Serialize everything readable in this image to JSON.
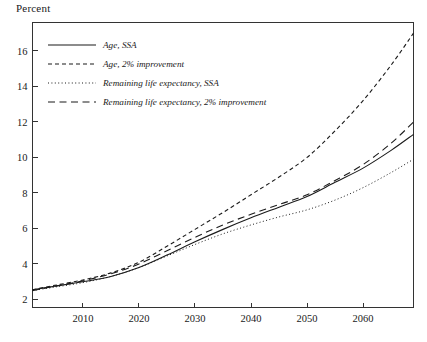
{
  "figure": {
    "ylabel_top": "Percent"
  },
  "chart_data": {
    "type": "line",
    "title": "",
    "xlabel": "",
    "ylabel": "Percent",
    "xlim": [
      2001,
      2069
    ],
    "ylim": [
      1.55,
      17.6
    ],
    "xticks": [
      2010,
      2020,
      2030,
      2040,
      2050,
      2060
    ],
    "xtick_labels": [
      "2010",
      "2020",
      "2030",
      "2040",
      "2050",
      "2060"
    ],
    "yticks": [
      2,
      4,
      6,
      8,
      10,
      12,
      14,
      16
    ],
    "ytick_labels": [
      "2",
      "4",
      "6",
      "8",
      "10",
      "12",
      "14",
      "16"
    ],
    "grid": false,
    "legend_position": "upper-left-inside",
    "x": [
      2001,
      2005,
      2010,
      2015,
      2020,
      2025,
      2030,
      2035,
      2040,
      2045,
      2050,
      2055,
      2060,
      2065,
      2069
    ],
    "series": [
      {
        "name": "Age, SSA",
        "style": "solid",
        "values": [
          2.55,
          2.75,
          3.0,
          3.3,
          3.8,
          4.5,
          5.25,
          5.95,
          6.6,
          7.2,
          7.8,
          8.6,
          9.4,
          10.4,
          11.3
        ]
      },
      {
        "name": "Age, 2% improvement",
        "style": "short-dash",
        "values": [
          2.55,
          2.8,
          3.1,
          3.5,
          4.1,
          5.0,
          5.95,
          6.9,
          7.9,
          8.9,
          10.0,
          11.5,
          13.2,
          15.2,
          17.0
        ]
      },
      {
        "name": "Remaining life expectancy, SSA",
        "style": "dotted",
        "values": [
          2.5,
          2.7,
          2.95,
          3.3,
          3.8,
          4.45,
          5.1,
          5.7,
          6.2,
          6.65,
          7.05,
          7.6,
          8.3,
          9.15,
          9.9
        ]
      },
      {
        "name": "Remaining life expectancy, 2% improvement",
        "style": "long-dash",
        "values": [
          2.5,
          2.75,
          3.05,
          3.45,
          4.0,
          4.75,
          5.5,
          6.2,
          6.8,
          7.35,
          7.9,
          8.7,
          9.6,
          10.8,
          12.0
        ]
      }
    ],
    "legend": [
      {
        "label": "Age, SSA",
        "style": "solid"
      },
      {
        "label": "Age, 2% improvement",
        "style": "short-dash"
      },
      {
        "label": "Remaining life expectancy, SSA",
        "style": "dotted"
      },
      {
        "label": "Remaining life expectancy, 2% improvement",
        "style": "long-dash"
      }
    ]
  }
}
